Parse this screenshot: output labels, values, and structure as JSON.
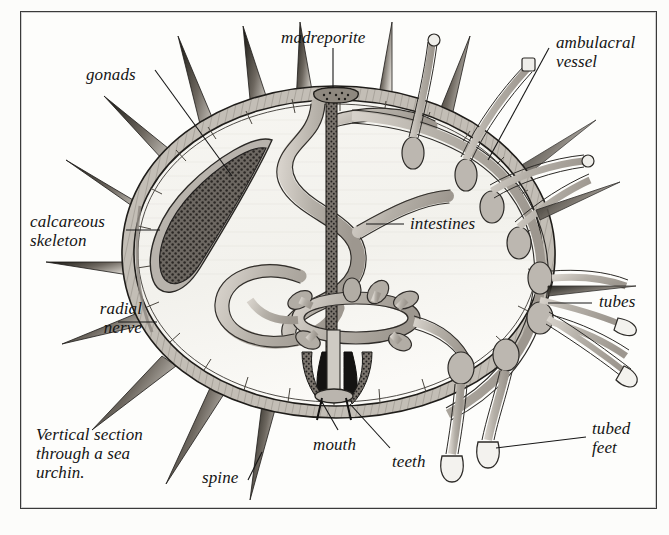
{
  "figure": {
    "domain": "Diagram",
    "kind": "labelled anatomical cross-section illustration",
    "subject": "sea urchin",
    "caption": "Vertical section\nthrough a sea\nurchin.",
    "frame": {
      "border_color": "#3a3a3a",
      "background": "#fdfdfb"
    },
    "style": {
      "ink": "#1a1a1a",
      "tissue_fill": "#b9b4ad",
      "tissue_fill_light": "#cdc9c2",
      "cavity_fill": "#f4f3ef",
      "gonad_fill": "#585450",
      "tooth_fill": "#1b1b1b",
      "leader_color": "#161616"
    }
  },
  "labels": [
    {
      "id": "gonads",
      "text": "gonads",
      "x": 86,
      "y": 65,
      "align": "left"
    },
    {
      "id": "madreporite",
      "text": "madreporite",
      "x": 281,
      "y": 28,
      "align": "left"
    },
    {
      "id": "ambulacral-vessel",
      "text": "ambulacral\nvessel",
      "x": 556,
      "y": 33,
      "align": "left"
    },
    {
      "id": "calcareous-skeleton",
      "text": "calcareous\nskeleton",
      "x": 30,
      "y": 212,
      "align": "left"
    },
    {
      "id": "radial-nerve",
      "text": "radial\nnerve",
      "x": 66,
      "y": 299,
      "align": "left"
    },
    {
      "id": "intestines",
      "text": "intestines",
      "x": 410,
      "y": 214,
      "align": "left"
    },
    {
      "id": "tubes",
      "text": "tubes",
      "x": 599,
      "y": 297,
      "align": "left"
    },
    {
      "id": "tubed-feet",
      "text": "tubed\nfeet",
      "x": 592,
      "y": 419,
      "align": "left"
    },
    {
      "id": "mouth",
      "text": "mouth",
      "x": 313,
      "y": 437,
      "align": "left"
    },
    {
      "id": "teeth",
      "text": "teeth",
      "x": 392,
      "y": 453,
      "align": "left"
    },
    {
      "id": "spine",
      "text": "spine",
      "x": 202,
      "y": 471,
      "align": "left"
    },
    {
      "id": "caption",
      "text": "Vertical section\nthrough a sea\nurchin.",
      "x": 36,
      "y": 425,
      "align": "left"
    }
  ],
  "parts": [
    {
      "name": "calcareous skeleton",
      "description": "layered test wall forming the ovoid body outline"
    },
    {
      "name": "spines",
      "description": "tapering dark spines radiating from the test"
    },
    {
      "name": "gonads",
      "description": "dark stippled teardrop organ in upper-left cavity"
    },
    {
      "name": "intestines",
      "description": "coiled S-shaped gut tube in the body cavity"
    },
    {
      "name": "madreporite",
      "description": "porous plate at the top of the test with stone canal"
    },
    {
      "name": "ambulacral vessel",
      "description": "water vascular canal running inside the test wall"
    },
    {
      "name": "tube feet / tubes",
      "description": "ampullae inside with tubes passing through the test"
    },
    {
      "name": "tubed feet",
      "description": "external sucker-tipped podia"
    },
    {
      "name": "radial nerve",
      "description": "nerve cord along the inner test wall"
    },
    {
      "name": "mouth",
      "description": "oral opening at the base"
    },
    {
      "name": "teeth",
      "description": "dark wedge-shaped teeth of Aristotle's lantern"
    },
    {
      "name": "ring canal",
      "description": "circular vessel with lobed projections above the mouth"
    }
  ]
}
